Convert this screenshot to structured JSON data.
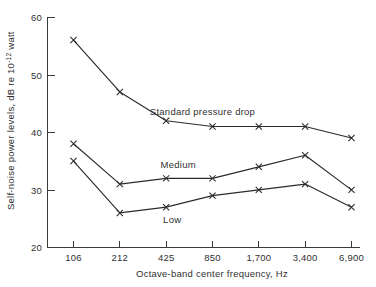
{
  "chart_data": {
    "type": "line",
    "title": "",
    "xlabel": "Octave-band center frequency, Hz",
    "ylabel": "Self-noise power levels, dB re 10",
    "ylabel_superscript": "-12",
    "ylabel_tail": " watt",
    "categories": [
      "106",
      "212",
      "425",
      "850",
      "1,700",
      "3,400",
      "6,900"
    ],
    "xticks": [
      "106",
      "212",
      "425",
      "850",
      "1,700",
      "3,400",
      "6,900"
    ],
    "yticks": [
      "60",
      "50",
      "40",
      "30",
      "20"
    ],
    "ylim": [
      20,
      60
    ],
    "grid": false,
    "legend_position": "inline-annotations",
    "marker": "x",
    "line_color": "#2b2b2b",
    "series": [
      {
        "name": "Standard pressure drop",
        "values": [
          56,
          47,
          42,
          41,
          41,
          41,
          39
        ],
        "label_x": "850",
        "label_dx": -10,
        "label_dy": -12
      },
      {
        "name": "Medium",
        "values": [
          38,
          31,
          32,
          32,
          34,
          36,
          30
        ],
        "label_x": "425",
        "label_dx": 12,
        "label_dy": -10
      },
      {
        "name": "Low",
        "values": [
          35,
          26,
          27,
          29,
          30,
          31,
          27
        ],
        "label_x": "425",
        "label_dx": 6,
        "label_dy": 16
      }
    ]
  },
  "axes": {
    "y_axis_label_full": "Self-noise power levels, dB re 10-12 watt",
    "x_axis_label_full": "Octave-band center frequency, Hz"
  }
}
